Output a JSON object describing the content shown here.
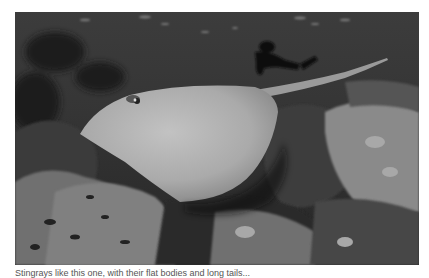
{
  "photo": {
    "subject": "stingray swimming over coral reef",
    "background_subject": "scuba diver",
    "tone": "grayscale",
    "colors": {
      "water": "#333333",
      "ray_body": "#b4b4b4",
      "reef_light": "#8a8a8a",
      "reef_dark": "#1c1c1c"
    }
  },
  "caption": {
    "text": "Stingrays like this one, with their flat bodies and long tails..."
  }
}
